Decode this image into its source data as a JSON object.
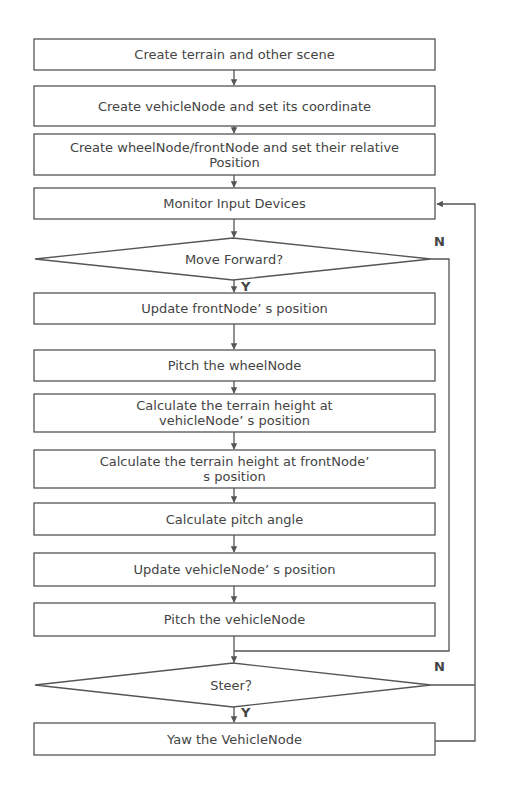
{
  "diagram": {
    "type": "flowchart",
    "colors": {
      "stroke": "#555555",
      "text": "#444444",
      "background": "#ffffff"
    },
    "steps": [
      {
        "id": "s1",
        "label": "Create terrain and other scene"
      },
      {
        "id": "s2",
        "label": "Create vehicleNode and set its coordinate"
      },
      {
        "id": "s3",
        "label": "Create wheelNode/frontNode and set their relative Position"
      },
      {
        "id": "s4",
        "label": "Monitor Input Devices"
      },
      {
        "id": "d1",
        "label": "Move Forward?",
        "shape": "diamond"
      },
      {
        "id": "s5",
        "label": "Update frontNode’ s position"
      },
      {
        "id": "s6",
        "label": "Pitch the wheelNode"
      },
      {
        "id": "s7",
        "label": "Calculate the terrain height at vehicleNode’ s position"
      },
      {
        "id": "s8",
        "label": "Calculate the terrain height at frontNode’ s position"
      },
      {
        "id": "s9",
        "label": "Calculate pitch angle"
      },
      {
        "id": "s10",
        "label": "Update vehicleNode’ s position"
      },
      {
        "id": "s11",
        "label": "Pitch the vehicleNode"
      },
      {
        "id": "d2",
        "label": "Steer？",
        "shape": "diamond"
      },
      {
        "id": "s12",
        "label": "Yaw the VehicleNode"
      }
    ],
    "branch_labels": {
      "d1_yes": "Y",
      "d1_no": "N",
      "d2_yes": "Y",
      "d2_no": "N"
    }
  }
}
